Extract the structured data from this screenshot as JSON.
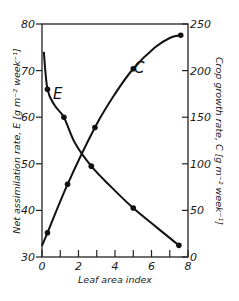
{
  "chart_data": {
    "type": "line",
    "title": "",
    "xlabel": "Leaf area index",
    "ylabel_left": "Net assimilation rate, E [g m⁻² week⁻¹]",
    "ylabel_right": "Crop growth rate, C [g m⁻² week⁻¹]",
    "xlim": [
      0,
      8
    ],
    "ylim_left": [
      30,
      80
    ],
    "ylim_right": [
      0,
      250
    ],
    "x_ticks": [
      "0",
      "2",
      "4",
      "6",
      "8"
    ],
    "y_ticks_left": [
      "30",
      "40",
      "50",
      "60",
      "70",
      "80"
    ],
    "y_ticks_right": [
      "0",
      "50",
      "100",
      "150",
      "200",
      "250"
    ],
    "grid": false,
    "legend": "inline",
    "series": [
      {
        "name": "E",
        "axis": "left",
        "label": "E",
        "points": [
          {
            "x": 0.3,
            "y": 66
          },
          {
            "x": 1.2,
            "y": 60
          },
          {
            "x": 2.7,
            "y": 49.5
          },
          {
            "x": 5.0,
            "y": 40.5
          },
          {
            "x": 7.5,
            "y": 32.5
          }
        ],
        "curve": [
          {
            "x": 0.1,
            "y": 74
          },
          {
            "x": 0.3,
            "y": 66
          },
          {
            "x": 0.7,
            "y": 62.5
          },
          {
            "x": 1.2,
            "y": 60
          },
          {
            "x": 1.8,
            "y": 54.5
          },
          {
            "x": 2.7,
            "y": 49.5
          },
          {
            "x": 3.8,
            "y": 45
          },
          {
            "x": 5.0,
            "y": 40.5
          },
          {
            "x": 6.3,
            "y": 36.3
          },
          {
            "x": 7.5,
            "y": 32.5
          }
        ]
      },
      {
        "name": "C",
        "axis": "right",
        "label": "C",
        "points": [
          {
            "x": 0.3,
            "y": 26
          },
          {
            "x": 1.4,
            "y": 78
          },
          {
            "x": 2.9,
            "y": 139
          },
          {
            "x": 5.0,
            "y": 202
          },
          {
            "x": 7.6,
            "y": 238
          }
        ],
        "curve": [
          {
            "x": 0.0,
            "y": 12
          },
          {
            "x": 0.3,
            "y": 26
          },
          {
            "x": 1.4,
            "y": 78
          },
          {
            "x": 2.9,
            "y": 139
          },
          {
            "x": 4.0,
            "y": 175
          },
          {
            "x": 5.0,
            "y": 202
          },
          {
            "x": 6.2,
            "y": 225
          },
          {
            "x": 7.0,
            "y": 235
          },
          {
            "x": 7.6,
            "y": 238
          }
        ]
      }
    ]
  },
  "colors": {
    "line": "#111111",
    "axis": "#222222",
    "background": "#ffffff"
  }
}
